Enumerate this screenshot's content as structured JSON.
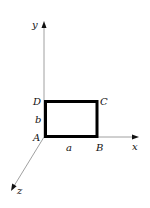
{
  "diagram": {
    "type": "coordinate-axes-with-rectangle",
    "axes": {
      "x": {
        "label": "x"
      },
      "y": {
        "label": "y"
      },
      "z": {
        "label": "z"
      }
    },
    "rectangle": {
      "vertices": {
        "A": "A",
        "B": "B",
        "C": "C",
        "D": "D"
      },
      "sides": {
        "width": "a",
        "height": "b"
      }
    },
    "colors": {
      "axis": "#888888",
      "rectangle": "#000000",
      "text": "#111111"
    }
  }
}
